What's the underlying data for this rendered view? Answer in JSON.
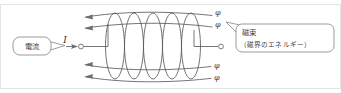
{
  "figure": {
    "kind": "physics-diagram",
    "width": 341,
    "height": 93,
    "background_color": "#ffffff",
    "line_color": "#6b6b6b",
    "text_color": "#3c3c3c"
  },
  "labels": {
    "current_callout": "電流",
    "current_symbol": "I",
    "flux_callout_line1": "磁束",
    "flux_callout_line2": "（磁界のエネルギー）",
    "flux_symbol": "φ"
  },
  "flux_symbols": [
    {
      "id": "phi-top-1",
      "text": "φ",
      "x": 215,
      "y": 14
    },
    {
      "id": "phi-top-2",
      "text": "φ",
      "x": 215,
      "y": 26
    },
    {
      "id": "phi-bottom-1",
      "text": "φ",
      "x": 214,
      "y": 67
    },
    {
      "id": "phi-bottom-2",
      "text": "φ",
      "x": 214,
      "y": 79
    }
  ],
  "coil": {
    "loop_count": 5,
    "description": "solenoid winding drawn as five overlapping ellipses"
  },
  "flux_lines": {
    "count": 4,
    "direction": "leftward",
    "arrow_side": "left"
  },
  "terminals": {
    "left_label": "I",
    "left_terminal_shape": "open-circle",
    "right_terminal_shape": "open-circle"
  }
}
